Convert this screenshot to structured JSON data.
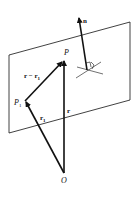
{
  "figure": {
    "colors": {
      "line": "#111111",
      "background": "#ffffff"
    },
    "labels": {
      "normal": "n",
      "point_p": "P",
      "point_p1": "P",
      "point_p1_sub": "1",
      "origin": "O",
      "vec_r": "r",
      "vec_r1": "r",
      "vec_r1_sub": "1",
      "vec_diff": "r − r",
      "vec_diff_sub": "1"
    },
    "plane": {
      "corners": [
        [
          9,
          55
        ],
        [
          130,
          22
        ],
        [
          130,
          100
        ],
        [
          9,
          133
        ]
      ]
    },
    "points": {
      "O": [
        64,
        173
      ],
      "P": [
        64,
        60
      ],
      "P1": [
        25,
        101
      ],
      "n_base": [
        87,
        70
      ],
      "n_tip": [
        79,
        17
      ]
    }
  }
}
